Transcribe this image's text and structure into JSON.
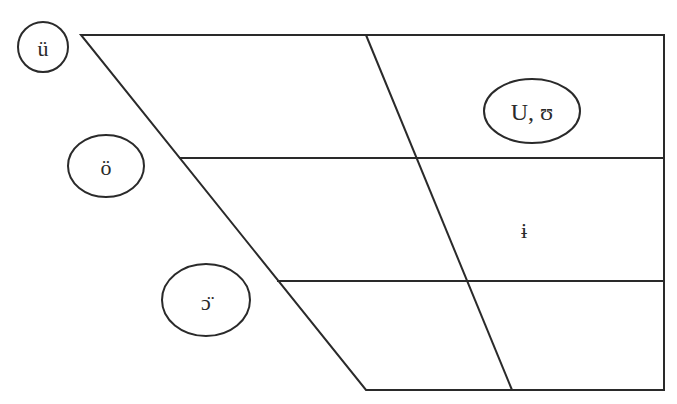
{
  "diagram": {
    "type": "vowel-chart-trapezoid",
    "grid": {
      "top_y": 35,
      "bottom_y": 390,
      "row_lines_y": [
        158,
        281
      ],
      "right_x": 664,
      "left_top_x": 81,
      "left_bottom_x": 366,
      "center_top_x": 366,
      "center_bottom_x": 512
    },
    "symbols": [
      {
        "id": "u-umlaut",
        "text": "ü",
        "circled": true,
        "cx": 43,
        "cy": 47,
        "rx": 25,
        "ry": 25
      },
      {
        "id": "o-umlaut",
        "text": "ö",
        "circled": true,
        "cx": 106,
        "cy": 166,
        "rx": 38,
        "ry": 31
      },
      {
        "id": "open-o-umlaut",
        "text": "ɔ̈",
        "circled": true,
        "cx": 206,
        "cy": 300,
        "rx": 44,
        "ry": 36
      },
      {
        "id": "u-upsilon",
        "text": "U, ʊ",
        "circled": true,
        "cx": 532,
        "cy": 111,
        "rx": 48,
        "ry": 32
      },
      {
        "id": "barred-i",
        "text": "ɨ",
        "circled": false,
        "cx": 524,
        "cy": 229
      }
    ]
  },
  "colors": {
    "line": "#2a2a2a",
    "background": "#ffffff"
  }
}
